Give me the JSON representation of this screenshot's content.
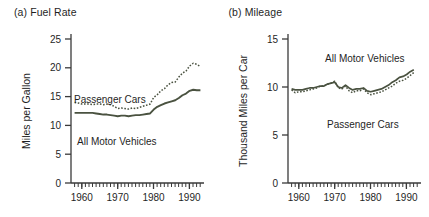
{
  "figure": {
    "background_color": "#ffffff",
    "line_color": "#4a5240",
    "axis_color": "#3a3a3a",
    "text_color": "#1f1f1f"
  },
  "panels": [
    {
      "id": "panel-a",
      "title": "(a)  Fuel Rate",
      "label": "(a)",
      "name": "Fuel Rate"
    },
    {
      "id": "panel-b",
      "title": "(b)  Mileage",
      "label": "(b)",
      "name": "Mileage"
    }
  ],
  "chart_data": [
    {
      "type": "line",
      "title": "(a)  Fuel Rate",
      "xlabel": "",
      "ylabel": "Miles per Gallon",
      "xlim": [
        1957,
        1994
      ],
      "ylim": [
        0,
        27
      ],
      "yticks": [
        0,
        5,
        10,
        15,
        20,
        25
      ],
      "ytick_labels": [
        "0",
        "5",
        "10",
        "15",
        "20",
        "25"
      ],
      "xticks": [
        1960,
        1970,
        1980,
        1990
      ],
      "xtick_labels": [
        "1960",
        "1970",
        "1980",
        "1990"
      ],
      "minor_xticks_every": 1,
      "grid": false,
      "legend": "inline-annotation",
      "x": [
        1958,
        1959,
        1960,
        1961,
        1962,
        1963,
        1964,
        1965,
        1966,
        1967,
        1968,
        1969,
        1970,
        1971,
        1972,
        1973,
        1974,
        1975,
        1976,
        1977,
        1978,
        1979,
        1980,
        1981,
        1982,
        1983,
        1984,
        1985,
        1986,
        1987,
        1988,
        1989,
        1990,
        1991,
        1992,
        1993
      ],
      "series": [
        {
          "name": "Passenger Cars",
          "style": "dotted",
          "color": "#4a5240",
          "values": [
            14.6,
            14.5,
            14.3,
            14.3,
            14.3,
            14.2,
            14.3,
            14.3,
            14.2,
            14.3,
            14.2,
            13.9,
            13.5,
            13.6,
            13.5,
            13.4,
            13.6,
            13.5,
            13.7,
            13.9,
            14.1,
            14.3,
            15.5,
            16.0,
            16.7,
            17.1,
            17.8,
            18.2,
            18.3,
            19.2,
            19.9,
            20.3,
            21.2,
            21.7,
            21.5,
            21.1
          ]
        },
        {
          "name": "All Motor Vehicles",
          "style": "solid",
          "color": "#4a5240",
          "values": [
            12.7,
            12.7,
            12.7,
            12.7,
            12.7,
            12.7,
            12.6,
            12.5,
            12.4,
            12.4,
            12.3,
            12.2,
            12.1,
            12.2,
            12.2,
            12.1,
            12.2,
            12.3,
            12.3,
            12.4,
            12.5,
            12.6,
            13.3,
            13.8,
            14.1,
            14.4,
            14.6,
            14.8,
            15.0,
            15.4,
            15.9,
            16.2,
            16.7,
            16.9,
            16.8,
            16.8
          ]
        }
      ]
    },
    {
      "type": "line",
      "title": "(b)  Mileage",
      "xlabel": "",
      "ylabel": "Thousand Miles per Car",
      "xlim": [
        1957,
        1994
      ],
      "ylim": [
        0,
        16.5
      ],
      "yticks": [
        0,
        5,
        10,
        15
      ],
      "ytick_labels": [
        "0",
        "5",
        "10",
        "15"
      ],
      "xticks": [
        1960,
        1970,
        1980,
        1990
      ],
      "xtick_labels": [
        "1960",
        "1970",
        "1980",
        "1990"
      ],
      "minor_xticks_every": 1,
      "grid": false,
      "legend": "inline-annotation",
      "x": [
        1958,
        1959,
        1960,
        1961,
        1962,
        1963,
        1964,
        1965,
        1966,
        1967,
        1968,
        1969,
        1970,
        1971,
        1972,
        1973,
        1974,
        1975,
        1976,
        1977,
        1978,
        1979,
        1980,
        1981,
        1982,
        1983,
        1984,
        1985,
        1986,
        1987,
        1988,
        1989,
        1990,
        1991,
        1992
      ],
      "series": [
        {
          "name": "All Motor Vehicles",
          "style": "solid",
          "color": "#4a5240",
          "values": [
            9.8,
            9.7,
            9.7,
            9.7,
            9.8,
            9.9,
            9.9,
            10.0,
            10.1,
            10.1,
            10.3,
            10.4,
            10.5,
            10.0,
            9.9,
            10.2,
            9.9,
            9.7,
            9.8,
            9.8,
            9.9,
            9.6,
            9.5,
            9.6,
            9.7,
            9.8,
            10.0,
            10.2,
            10.5,
            10.7,
            11.0,
            11.1,
            11.3,
            11.6,
            11.8
          ]
        },
        {
          "name": "Passenger Cars",
          "style": "dotted",
          "color": "#4a5240",
          "values": [
            9.7,
            9.4,
            9.5,
            9.5,
            9.6,
            9.7,
            9.8,
            9.9,
            10.1,
            10.1,
            10.3,
            10.4,
            10.6,
            9.9,
            9.8,
            10.1,
            9.6,
            9.4,
            9.6,
            9.6,
            9.8,
            9.4,
            9.2,
            9.3,
            9.4,
            9.5,
            9.7,
            9.9,
            10.1,
            10.4,
            10.6,
            10.7,
            10.9,
            11.2,
            11.5
          ]
        }
      ],
      "annotations": [
        {
          "text": "All Motor Vehicles",
          "series": "All Motor Vehicles"
        },
        {
          "text": "Passenger Cars",
          "series": "Passenger Cars"
        }
      ]
    }
  ]
}
